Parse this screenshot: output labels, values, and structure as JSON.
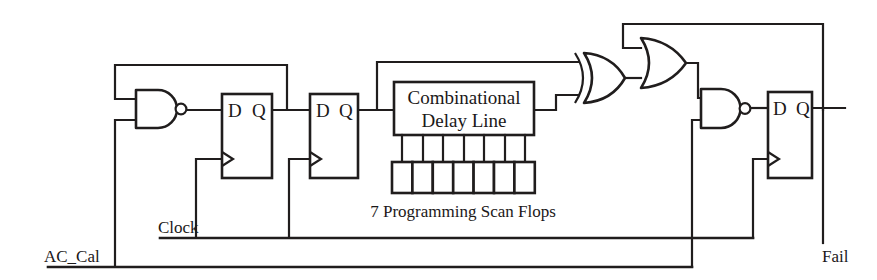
{
  "diagram": {
    "background_color": "#ffffff",
    "ink_color": "#201d1d",
    "width": 877,
    "height": 280
  },
  "signals": {
    "ac_cal": "AC_Cal",
    "clock": "Clock",
    "fail": "Fail"
  },
  "blocks": {
    "delay_line": {
      "line1": "Combinational",
      "line2": "Delay Line"
    },
    "scan_flops_caption": "7 Programming Scan Flops",
    "scan_flops_count": 7
  },
  "flops": {
    "flop1": {
      "d": "D",
      "q": "Q"
    },
    "flop2": {
      "d": "D",
      "q": "Q"
    },
    "flop3": {
      "d": "D",
      "q": "Q"
    }
  },
  "gates": {
    "nand_left": {
      "type": "NAND",
      "inputs": 2
    },
    "xor": {
      "type": "XOR",
      "inputs": 2
    },
    "or": {
      "type": "OR",
      "inputs": 2
    },
    "nand_right": {
      "type": "NAND",
      "inputs": 2
    }
  }
}
